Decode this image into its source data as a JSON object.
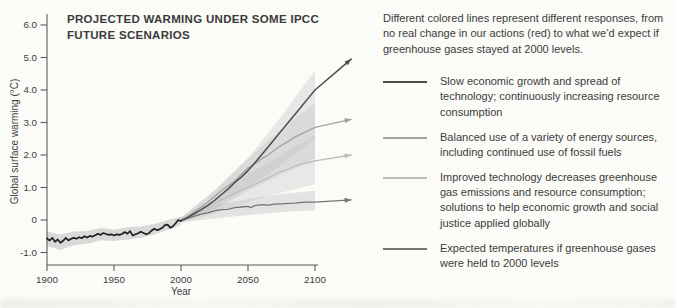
{
  "page": {
    "background": "#fbfbf8"
  },
  "chart": {
    "title_line1": "PROJECTED WARMING UNDER SOME IPCC",
    "title_line2": "FUTURE SCENARIOS",
    "ylabel": "Global surface warming (°C)",
    "xlabel": "Year"
  },
  "chart_data": {
    "type": "line",
    "title": "PROJECTED WARMING UNDER SOME IPCC FUTURE SCENARIOS",
    "xlabel": "Year",
    "ylabel": "Global surface warming (°C)",
    "xlim": [
      1900,
      2130
    ],
    "ylim": [
      -1.4,
      6.3
    ],
    "grid": false,
    "legend_position": "right",
    "axis_color": "#5a5a5a",
    "x_ticks": [
      {
        "v": 1900,
        "label": "1900"
      },
      {
        "v": 1950,
        "label": "1950"
      },
      {
        "v": 2000,
        "label": "2000"
      },
      {
        "v": 2050,
        "label": "2050"
      },
      {
        "v": 2100,
        "label": "2100"
      }
    ],
    "y_ticks": [
      {
        "v": -1.0,
        "label": "-1.0"
      },
      {
        "v": 0,
        "label": "0"
      },
      {
        "v": 1.0,
        "label": "1.0"
      },
      {
        "v": 2.0,
        "label": "2.0"
      },
      {
        "v": 3.0,
        "label": "3.0"
      },
      {
        "v": 4.0,
        "label": "4.0"
      },
      {
        "v": 5.0,
        "label": "5.0"
      },
      {
        "v": 6.0,
        "label": "6.0"
      }
    ],
    "bands": [
      {
        "id": "historical-uncertainty",
        "color": "#bdbdbd",
        "opacity": 0.55,
        "upper": [
          [
            1900,
            -0.35
          ],
          [
            1910,
            -0.45
          ],
          [
            1920,
            -0.35
          ],
          [
            1930,
            -0.34
          ],
          [
            1940,
            -0.25
          ],
          [
            1950,
            -0.3
          ],
          [
            1960,
            -0.22
          ],
          [
            1970,
            -0.2
          ],
          [
            1980,
            -0.12
          ],
          [
            1990,
            0.0
          ],
          [
            2000,
            0.1
          ]
        ],
        "lower": [
          [
            1900,
            -0.8
          ],
          [
            1910,
            -0.92
          ],
          [
            1920,
            -0.78
          ],
          [
            1930,
            -0.73
          ],
          [
            1940,
            -0.62
          ],
          [
            1950,
            -0.65
          ],
          [
            1960,
            -0.6
          ],
          [
            1970,
            -0.55
          ],
          [
            1980,
            -0.45
          ],
          [
            1990,
            -0.3
          ],
          [
            2000,
            -0.15
          ]
        ]
      },
      {
        "id": "slow-growth-range",
        "color": "#bdbdbd",
        "opacity": 0.32,
        "upper": [
          [
            2000,
            0.08
          ],
          [
            2025,
            0.9
          ],
          [
            2050,
            1.9
          ],
          [
            2075,
            3.2
          ],
          [
            2100,
            4.6
          ]
        ],
        "lower": [
          [
            2000,
            -0.08
          ],
          [
            2025,
            0.35
          ],
          [
            2050,
            1.0
          ],
          [
            2075,
            1.7
          ],
          [
            2100,
            2.5
          ]
        ]
      },
      {
        "id": "balanced-range",
        "color": "#bdbdbd",
        "opacity": 0.32,
        "upper": [
          [
            2000,
            0.08
          ],
          [
            2025,
            0.9
          ],
          [
            2050,
            1.9
          ],
          [
            2075,
            2.8
          ],
          [
            2100,
            3.6
          ]
        ],
        "lower": [
          [
            2000,
            -0.08
          ],
          [
            2025,
            0.3
          ],
          [
            2050,
            0.9
          ],
          [
            2075,
            1.4
          ],
          [
            2100,
            1.9
          ]
        ]
      },
      {
        "id": "improved-tech-range",
        "color": "#bdbdbd",
        "opacity": 0.3,
        "upper": [
          [
            2000,
            0.08
          ],
          [
            2025,
            0.7
          ],
          [
            2050,
            1.4
          ],
          [
            2075,
            2.0
          ],
          [
            2100,
            2.6
          ]
        ],
        "lower": [
          [
            2000,
            -0.08
          ],
          [
            2025,
            0.2
          ],
          [
            2050,
            0.55
          ],
          [
            2075,
            0.85
          ],
          [
            2100,
            1.1
          ]
        ]
      },
      {
        "id": "constant-2000-range",
        "color": "#bdbdbd",
        "opacity": 0.38,
        "upper": [
          [
            2000,
            0.08
          ],
          [
            2025,
            0.45
          ],
          [
            2050,
            0.65
          ],
          [
            2075,
            0.8
          ],
          [
            2100,
            0.9
          ]
        ],
        "lower": [
          [
            2000,
            -0.08
          ],
          [
            2025,
            0.05
          ],
          [
            2050,
            0.15
          ],
          [
            2075,
            0.25
          ],
          [
            2100,
            0.3
          ]
        ]
      }
    ],
    "series": [
      {
        "id": "improved-tech",
        "name": "Improved technology; solutions applied globally",
        "color": "#bcbcbc",
        "width": 1.3,
        "arrow": true,
        "points": [
          [
            2000,
            -0.02
          ],
          [
            2005,
            0.08
          ],
          [
            2010,
            0.18
          ],
          [
            2015,
            0.3
          ],
          [
            2020,
            0.4
          ],
          [
            2025,
            0.5
          ],
          [
            2030,
            0.62
          ],
          [
            2035,
            0.72
          ],
          [
            2040,
            0.82
          ],
          [
            2045,
            0.92
          ],
          [
            2050,
            1.0
          ],
          [
            2055,
            1.1
          ],
          [
            2060,
            1.2
          ],
          [
            2065,
            1.3
          ],
          [
            2070,
            1.4
          ],
          [
            2075,
            1.5
          ],
          [
            2080,
            1.57
          ],
          [
            2085,
            1.65
          ],
          [
            2090,
            1.72
          ],
          [
            2095,
            1.77
          ],
          [
            2100,
            1.82
          ],
          [
            2127,
            2.0
          ]
        ]
      },
      {
        "id": "balanced-energy",
        "name": "Balanced use of a variety of energy sources",
        "color": "#a3a3a3",
        "width": 1.3,
        "arrow": true,
        "points": [
          [
            2000,
            -0.02
          ],
          [
            2005,
            0.1
          ],
          [
            2010,
            0.25
          ],
          [
            2015,
            0.4
          ],
          [
            2020,
            0.55
          ],
          [
            2025,
            0.72
          ],
          [
            2030,
            0.9
          ],
          [
            2035,
            1.05
          ],
          [
            2040,
            1.2
          ],
          [
            2045,
            1.4
          ],
          [
            2050,
            1.6
          ],
          [
            2055,
            1.72
          ],
          [
            2060,
            1.88
          ],
          [
            2065,
            2.0
          ],
          [
            2070,
            2.15
          ],
          [
            2075,
            2.3
          ],
          [
            2080,
            2.42
          ],
          [
            2085,
            2.55
          ],
          [
            2090,
            2.65
          ],
          [
            2095,
            2.75
          ],
          [
            2100,
            2.85
          ],
          [
            2127,
            3.1
          ]
        ]
      },
      {
        "id": "constant-2000",
        "name": "Greenhouse gases held to 2000 levels",
        "color": "#757575",
        "width": 1.3,
        "arrow": true,
        "points": [
          [
            2000,
            -0.02
          ],
          [
            2005,
            0.05
          ],
          [
            2010,
            0.12
          ],
          [
            2015,
            0.18
          ],
          [
            2020,
            0.22
          ],
          [
            2025,
            0.28
          ],
          [
            2030,
            0.32
          ],
          [
            2035,
            0.33
          ],
          [
            2040,
            0.38
          ],
          [
            2045,
            0.4
          ],
          [
            2050,
            0.42
          ],
          [
            2052,
            0.38
          ],
          [
            2055,
            0.44
          ],
          [
            2060,
            0.47
          ],
          [
            2065,
            0.46
          ],
          [
            2070,
            0.49
          ],
          [
            2075,
            0.5
          ],
          [
            2080,
            0.51
          ],
          [
            2085,
            0.52
          ],
          [
            2090,
            0.54
          ],
          [
            2095,
            0.55
          ],
          [
            2100,
            0.55
          ],
          [
            2127,
            0.62
          ]
        ]
      },
      {
        "id": "slow-growth",
        "name": "Slow economic growth; increasing consumption",
        "color": "#4d4d4d",
        "width": 1.5,
        "arrow": true,
        "points": [
          [
            2000,
            -0.02
          ],
          [
            2005,
            0.08
          ],
          [
            2010,
            0.2
          ],
          [
            2015,
            0.32
          ],
          [
            2020,
            0.45
          ],
          [
            2025,
            0.6
          ],
          [
            2030,
            0.78
          ],
          [
            2035,
            0.95
          ],
          [
            2040,
            1.15
          ],
          [
            2045,
            1.32
          ],
          [
            2050,
            1.52
          ],
          [
            2055,
            1.75
          ],
          [
            2060,
            2.0
          ],
          [
            2065,
            2.25
          ],
          [
            2070,
            2.5
          ],
          [
            2075,
            2.75
          ],
          [
            2080,
            3.0
          ],
          [
            2085,
            3.25
          ],
          [
            2090,
            3.5
          ],
          [
            2095,
            3.75
          ],
          [
            2100,
            4.0
          ],
          [
            2127,
            4.95
          ]
        ]
      },
      {
        "id": "historical",
        "name": "Observed 20th century warming",
        "color": "#1f1f1f",
        "width": 1.7,
        "arrow": false,
        "points": [
          [
            1900,
            -0.57
          ],
          [
            1902,
            -0.63
          ],
          [
            1904,
            -0.55
          ],
          [
            1906,
            -0.67
          ],
          [
            1908,
            -0.6
          ],
          [
            1910,
            -0.7
          ],
          [
            1912,
            -0.64
          ],
          [
            1914,
            -0.55
          ],
          [
            1916,
            -0.63
          ],
          [
            1918,
            -0.58
          ],
          [
            1920,
            -0.55
          ],
          [
            1922,
            -0.58
          ],
          [
            1924,
            -0.53
          ],
          [
            1926,
            -0.56
          ],
          [
            1928,
            -0.5
          ],
          [
            1930,
            -0.54
          ],
          [
            1932,
            -0.49
          ],
          [
            1934,
            -0.51
          ],
          [
            1936,
            -0.47
          ],
          [
            1938,
            -0.42
          ],
          [
            1940,
            -0.46
          ],
          [
            1942,
            -0.4
          ],
          [
            1944,
            -0.43
          ],
          [
            1946,
            -0.46
          ],
          [
            1948,
            -0.44
          ],
          [
            1950,
            -0.48
          ],
          [
            1952,
            -0.44
          ],
          [
            1954,
            -0.46
          ],
          [
            1956,
            -0.43
          ],
          [
            1958,
            -0.37
          ],
          [
            1960,
            -0.42
          ],
          [
            1962,
            -0.34
          ],
          [
            1964,
            -0.48
          ],
          [
            1966,
            -0.44
          ],
          [
            1968,
            -0.41
          ],
          [
            1970,
            -0.36
          ],
          [
            1972,
            -0.4
          ],
          [
            1974,
            -0.44
          ],
          [
            1976,
            -0.41
          ],
          [
            1978,
            -0.33
          ],
          [
            1980,
            -0.27
          ],
          [
            1982,
            -0.31
          ],
          [
            1984,
            -0.29
          ],
          [
            1986,
            -0.24
          ],
          [
            1988,
            -0.16
          ],
          [
            1990,
            -0.14
          ],
          [
            1992,
            -0.24
          ],
          [
            1994,
            -0.19
          ],
          [
            1996,
            -0.1
          ],
          [
            1998,
            0.0
          ],
          [
            2000,
            -0.03
          ]
        ]
      }
    ]
  },
  "sidebar": {
    "intro": "Different colored lines represent different responses, from no real change in our actions (red) to what we’d expect if greenhouse gases stayed at 2000 levels.",
    "legend": [
      {
        "label": "Slow economic growth and spread of technology; continuously increasing resource consumption",
        "color": "#4d4d4d"
      },
      {
        "label": "Balanced use of a variety of energy sources, including continued use of fossil fuels",
        "color": "#a3a3a3"
      },
      {
        "label": "Improved technology decreases greenhouse gas emissions and resource consumption; solutions to help economic growth and social justice applied globally",
        "color": "#bcbcbc"
      },
      {
        "label": "Expected temperatures if greenhouse gases were held to 2000 levels",
        "color": "#757575"
      }
    ]
  }
}
